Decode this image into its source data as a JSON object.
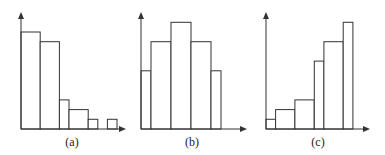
{
  "figure": {
    "panels": [
      {
        "label": "(a)"
      },
      {
        "label": "(b)"
      },
      {
        "label": "(c)"
      }
    ]
  },
  "chart_data": [
    {
      "type": "bar",
      "title": "(a)",
      "description": "Right-skewed histogram",
      "xlabel": "",
      "ylabel": "",
      "bins": [
        [
          0,
          1
        ],
        [
          1,
          2
        ],
        [
          2,
          2.5
        ],
        [
          2.5,
          3.5
        ],
        [
          3.5,
          4
        ],
        [
          4.5,
          5
        ]
      ],
      "values": [
        10,
        9,
        3,
        2,
        1,
        1
      ],
      "ylim": [
        0,
        12
      ],
      "grid": false
    },
    {
      "type": "bar",
      "title": "(b)",
      "description": "Symmetric histogram",
      "xlabel": "",
      "ylabel": "",
      "bins": [
        [
          0,
          0.5
        ],
        [
          0.5,
          1.5
        ],
        [
          1.5,
          2.5
        ],
        [
          2.5,
          3.5
        ],
        [
          3.5,
          4
        ]
      ],
      "values": [
        6,
        9,
        11,
        9,
        6
      ],
      "ylim": [
        0,
        12
      ],
      "grid": false
    },
    {
      "type": "bar",
      "title": "(c)",
      "description": "Left-skewed histogram",
      "xlabel": "",
      "ylabel": "",
      "bins": [
        [
          0,
          0.5
        ],
        [
          0.5,
          1.5
        ],
        [
          1.5,
          2.5
        ],
        [
          2.5,
          3
        ],
        [
          3,
          4
        ],
        [
          4,
          4.5
        ]
      ],
      "values": [
        1,
        2,
        3,
        7,
        9,
        11
      ],
      "ylim": [
        0,
        12
      ],
      "grid": false
    }
  ]
}
